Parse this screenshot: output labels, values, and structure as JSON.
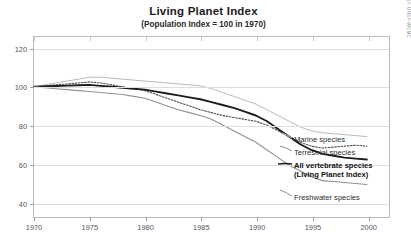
{
  "chart_data": {
    "type": "line",
    "title": "Living Planet Index",
    "subtitle": "(Population Index = 100 in 1970)",
    "xlabel": "",
    "ylabel": "",
    "xlim": [
      1970,
      2002
    ],
    "ylim": [
      32,
      126
    ],
    "grid": true,
    "legend_position": "right-inline",
    "source_note": "Data source: WWF, UNEP-WCMC",
    "x_ticks": [
      1970,
      1975,
      1980,
      1985,
      1990,
      1995,
      2000
    ],
    "y_ticks": [
      40,
      60,
      80,
      100,
      120
    ],
    "x": [
      1970,
      1971,
      1972,
      1973,
      1974,
      1975,
      1976,
      1977,
      1978,
      1979,
      1980,
      1981,
      1982,
      1983,
      1984,
      1985,
      1986,
      1987,
      1988,
      1989,
      1990,
      1991,
      1992,
      1993,
      1994,
      1995,
      1996,
      1997,
      1998,
      1999,
      2000
    ],
    "series": [
      {
        "name": "Marine species",
        "style": "solid-light",
        "color": "#b6b9bd",
        "width": 1.0,
        "values": [
          100,
          101,
          102,
          103,
          104,
          105,
          105,
          104.5,
          104,
          103.5,
          103,
          102.5,
          102,
          101.5,
          101,
          100.5,
          99,
          97,
          95,
          93,
          91,
          88,
          85,
          82,
          79,
          77,
          76,
          75.5,
          75,
          74.5,
          74
        ]
      },
      {
        "name": "Terrestrial species",
        "style": "dotted",
        "color": "#4a4a4a",
        "width": 1.1,
        "values": [
          100,
          100.5,
          101,
          101.5,
          102,
          102.5,
          102,
          101,
          100,
          99,
          98,
          96,
          94,
          92,
          90,
          88,
          86.5,
          85,
          84,
          83,
          82,
          80,
          77,
          74,
          71,
          69,
          68,
          68.5,
          69,
          69.5,
          69
        ]
      },
      {
        "name": "All vertebrate species",
        "name_line2": "(Living Planet Index)",
        "style": "solid-bold",
        "color": "#1c1c1c",
        "width": 1.9,
        "values": [
          100,
          100.2,
          100.4,
          100.6,
          100.8,
          101,
          100.5,
          100,
          99.5,
          99,
          98.5,
          97.5,
          96.5,
          95.5,
          94.5,
          93.5,
          92,
          90.5,
          89,
          87,
          85,
          82,
          78,
          74,
          70,
          67,
          65,
          64,
          63,
          62.5,
          62
        ]
      },
      {
        "name": "Freshwater species",
        "style": "solid-mid",
        "color": "#8d9195",
        "width": 1.1,
        "values": [
          100,
          99.5,
          99,
          98.5,
          98,
          97.5,
          97,
          96.5,
          96,
          95,
          94,
          92,
          90,
          88,
          86.5,
          85,
          83,
          80,
          77,
          74,
          71,
          67,
          63,
          59,
          56,
          53,
          51,
          50.5,
          50,
          49.5,
          49
        ]
      }
    ]
  },
  "legend": [
    {
      "label": "Marine species"
    },
    {
      "label": "Terrestrial species"
    },
    {
      "label": "All vertebrate species"
    },
    {
      "label": "(Living Planet Index)"
    },
    {
      "label": "Freshwater species"
    }
  ]
}
